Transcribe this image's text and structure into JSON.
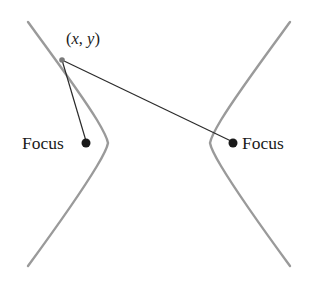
{
  "figure": {
    "background_color": "#ffffff",
    "width": 317,
    "height": 285
  },
  "labels": {
    "focus_left": "Focus",
    "focus_right": "Focus",
    "point": "(x, y)",
    "point_open_paren": "(",
    "point_x": "x",
    "point_comma": ", ",
    "point_y": "y",
    "point_close_paren": ")"
  },
  "colors": {
    "curve": "#9a9a9a",
    "segment": "#2b2b2b",
    "dot": "#1a1a1a",
    "text": "#1a1a1a"
  },
  "geometry": {
    "center": {
      "x": 159,
      "y": 143
    },
    "vertex_left": {
      "x": 108,
      "y": 143
    },
    "vertex_right": {
      "x": 210,
      "y": 143
    },
    "focus_left_point": {
      "x": 86,
      "y": 143
    },
    "focus_right_point": {
      "x": 233,
      "y": 143
    },
    "point_xy": {
      "x": 62,
      "y": 60
    },
    "dot_radius": 4.5,
    "focus_point_radius": 4.5,
    "curve_stroke_width": 2.4,
    "segment_stroke_width": 1.2,
    "left_branch_path": "M 28 22 C 50 52 82 95 97 120 C 103 130 107 137 108 143 C 107 149 103 156 97 166 C 82 191 50 236 28 266",
    "right_branch_path": "M 290 22 C 268 52 236 95 221 120 C 215 130 211 137 210 143 C 211 149 215 156 221 166 C 236 191 268 236 290 266",
    "segment_to_left_focus": {
      "x1": 62,
      "y1": 60,
      "x2": 86,
      "y2": 141
    },
    "segment_to_right_focus": {
      "x1": 62,
      "y1": 60,
      "x2": 231,
      "y2": 141
    }
  }
}
